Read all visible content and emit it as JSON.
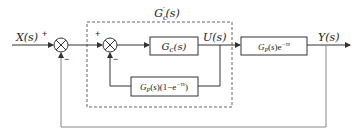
{
  "diagram": {
    "type": "block-diagram",
    "input_label": "X(s)",
    "output_label": "Y(s)",
    "intermediate_label": "U(s)",
    "dashed_box_label": "G'c(s)",
    "blocks": [
      {
        "id": "controller",
        "label": "Gc(s)"
      },
      {
        "id": "plant",
        "label": "GP(s)e",
        "exponent": "−τs"
      },
      {
        "id": "predictor",
        "label": "GP(s)(1−e",
        "exponent": "−τs",
        "suffix": ")"
      }
    ],
    "summing_junctions": [
      {
        "id": "outer-sum",
        "top_sign": "+",
        "bottom_sign": "−"
      },
      {
        "id": "inner-sum",
        "top_sign": "+",
        "bottom_sign": "−"
      }
    ],
    "colors": {
      "stroke": "#333333",
      "feedback_line": "#888888",
      "dashed_box": "#555555"
    }
  }
}
